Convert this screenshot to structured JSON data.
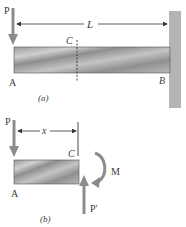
{
  "figure_a": {
    "caption": "(a)",
    "load_label": "P",
    "length_label": "L",
    "section_label": "C",
    "left_end_label": "A",
    "right_end_label": "B"
  },
  "figure_b": {
    "caption": "(b)",
    "load_label": "P",
    "distance_label": "x",
    "section_label": "C",
    "left_end_label": "A",
    "moment_label": "M",
    "shear_label": "P'"
  },
  "colors": {
    "beam_light": "#c8c8c8",
    "beam_dark": "#8a8a8a",
    "wall": "#b4b4b4",
    "arrow": "#8c8c8c",
    "line": "#333333"
  }
}
